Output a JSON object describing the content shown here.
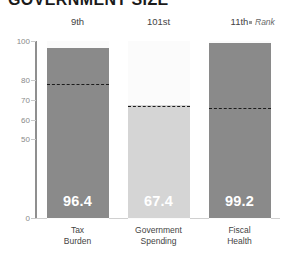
{
  "chart": {
    "title": "GOVERNMENT SIZE",
    "rank_legend": "Rank"
  },
  "chart_data": {
    "type": "bar",
    "title": "GOVERNMENT SIZE",
    "xlabel": "",
    "ylabel": "",
    "ylim": [
      0,
      100
    ],
    "grid": false,
    "legend": "Rank",
    "ytick_labels": [
      "100",
      "80",
      "70",
      "60",
      "50",
      "0"
    ],
    "ytick_values": [
      100,
      80,
      70,
      60,
      50,
      0
    ],
    "categories": [
      "Tax Burden",
      "Government Spending",
      "Fiscal Health"
    ],
    "values": [
      96.4,
      67.4,
      99.2
    ],
    "value_labels": [
      "96.4",
      "67.4",
      "99.2"
    ],
    "ranks": [
      "9th",
      "101st",
      "11th"
    ],
    "reference_lines": [
      78.0,
      67.0,
      66.0
    ],
    "bar_colors": [
      "#8a8a8a",
      "#d5d5d5",
      "#8a8a8a"
    ],
    "series": [
      {
        "name": "Score",
        "values": [
          96.4,
          67.4,
          99.2
        ]
      },
      {
        "name": "World Average (dashed)",
        "values": [
          78.0,
          67.0,
          66.0
        ]
      }
    ]
  },
  "bars": [
    {
      "category_line1": "Tax",
      "category_line2": "Burden",
      "rank": "9th",
      "value_label": "96.4",
      "value": 96.4,
      "reference": 78.0,
      "color": "#8a8a8a"
    },
    {
      "category_line1": "Government",
      "category_line2": "Spending",
      "rank": "101st",
      "value_label": "67.4",
      "value": 67.4,
      "reference": 67.0,
      "color": "#d5d5d5"
    },
    {
      "category_line1": "Fiscal",
      "category_line2": "Health",
      "rank": "11th",
      "value_label": "99.2",
      "value": 99.2,
      "reference": 66.0,
      "color": "#8a8a8a"
    }
  ],
  "yticks": [
    {
      "label": "100",
      "value": 100
    },
    {
      "label": "80",
      "value": 80
    },
    {
      "label": "70",
      "value": 70
    },
    {
      "label": "60",
      "value": 60
    },
    {
      "label": "50",
      "value": 50
    },
    {
      "label": "0",
      "value": 0
    }
  ]
}
